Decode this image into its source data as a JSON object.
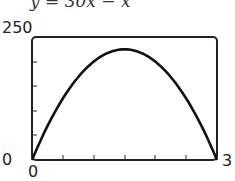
{
  "chart_data": {
    "type": "line",
    "xlabel": "",
    "ylabel": "",
    "xlim": [
      0,
      30
    ],
    "ylim": [
      0,
      250
    ],
    "x_tick_labels": {
      "min": "0",
      "max": "3"
    },
    "y_tick_labels": {
      "min": "0",
      "max": "250"
    },
    "x_ticks_interior": 5,
    "y_ticks_interior": 4,
    "grid": false,
    "series": [
      {
        "name": "y = 30x − x²",
        "x": [
          0,
          3,
          6,
          9,
          12,
          15,
          18,
          21,
          24,
          27,
          30
        ],
        "values": [
          0,
          81,
          144,
          189,
          216,
          225,
          216,
          189,
          144,
          81,
          0
        ]
      }
    ]
  },
  "labels": {
    "title": "y = 30x − x",
    "y_max": "250",
    "y_min": "0",
    "x_min": "0",
    "x_max": "3"
  }
}
